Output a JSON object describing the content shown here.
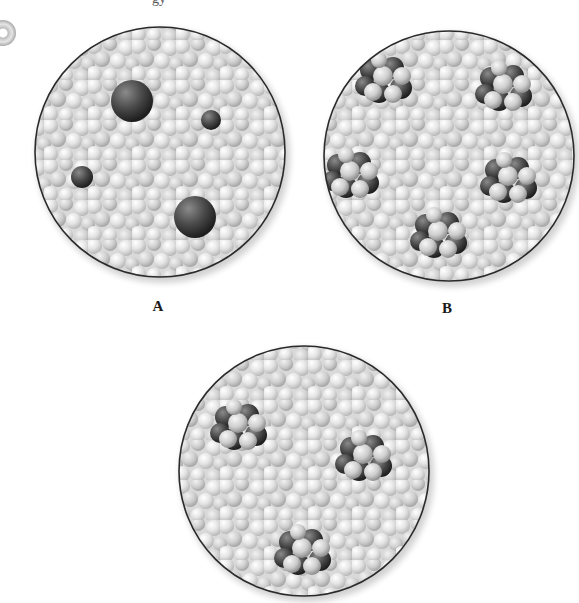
{
  "figure": {
    "top_text_fragments": [
      "gy",
      "  "
    ],
    "panels": [
      {
        "id": "A",
        "label": "A",
        "center": [
          160,
          152
        ],
        "radius": 125,
        "description": "solvent particles with dispersed single solute spheres",
        "solutes": [
          {
            "type": "sphere",
            "cx": 132,
            "cy": 101,
            "r": 21
          },
          {
            "type": "sphere",
            "cx": 211,
            "cy": 120,
            "r": 10
          },
          {
            "type": "sphere",
            "cx": 82,
            "cy": 177,
            "r": 11
          },
          {
            "type": "sphere",
            "cx": 195,
            "cy": 217,
            "r": 21
          }
        ]
      },
      {
        "id": "B",
        "label": "B",
        "center": [
          449,
          156
        ],
        "radius": 125,
        "description": "solvent particles with five dispersed clusters",
        "solutes": [
          {
            "type": "cluster",
            "cx": 385,
            "cy": 80
          },
          {
            "type": "cluster",
            "cx": 505,
            "cy": 88
          },
          {
            "type": "cluster",
            "cx": 352,
            "cy": 175
          },
          {
            "type": "cluster",
            "cx": 510,
            "cy": 180
          },
          {
            "type": "cluster",
            "cx": 440,
            "cy": 235
          }
        ]
      },
      {
        "id": "C",
        "label": "",
        "center": [
          304,
          471
        ],
        "radius": 125,
        "description": "solvent particles with three dispersed clusters",
        "solutes": [
          {
            "type": "cluster",
            "cx": 240,
            "cy": 427
          },
          {
            "type": "cluster",
            "cx": 365,
            "cy": 458
          },
          {
            "type": "cluster",
            "cx": 304,
            "cy": 552
          }
        ]
      }
    ],
    "colors": {
      "background": "#ffffff",
      "circle_outline": "#2a2a2a",
      "solvent_light": "#e9e9e9",
      "solvent_mid": "#c8c8c8",
      "solute_dark": "#3c3c3c",
      "cluster_light": "#d6d6d6"
    },
    "icons": [
      "disc-icon"
    ]
  }
}
